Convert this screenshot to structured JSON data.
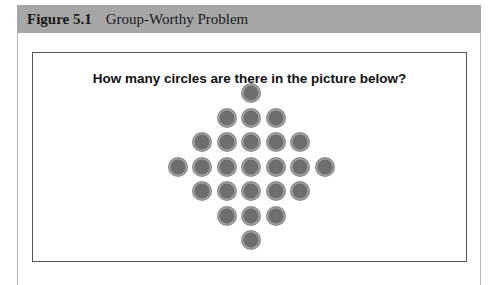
{
  "figure": {
    "number": "Figure 5.1",
    "title": "Group-Worthy Problem"
  },
  "problem": {
    "question": "How many circles are there in the picture below?",
    "circle_rows": [
      1,
      3,
      5,
      7,
      5,
      3,
      1
    ],
    "circle_color": "#6e6e6e"
  }
}
